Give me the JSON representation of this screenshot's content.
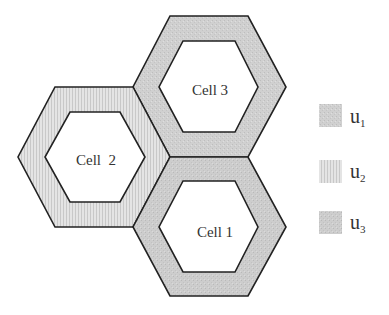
{
  "diagram": {
    "cells": [
      {
        "id": "cell-1",
        "label": "Cell 1",
        "user": "u3"
      },
      {
        "id": "cell-2",
        "label": "Cell  2",
        "user": "u2"
      },
      {
        "id": "cell-3",
        "label": "Cell 3",
        "user": "u1"
      }
    ],
    "legend": [
      {
        "base": "u",
        "sub": "1",
        "pattern": "gray-dotted",
        "color": "#cfcfcf"
      },
      {
        "base": "u",
        "sub": "2",
        "pattern": "vertical-stripes",
        "color": "#dedede"
      },
      {
        "base": "u",
        "sub": "3",
        "pattern": "gray-dotted",
        "color": "#cccccc"
      }
    ],
    "colors": {
      "stroke": "#222222",
      "u1": "#cfcfcf",
      "u2": "#dedede",
      "u3": "#cccccc",
      "inner": "#ffffff"
    }
  }
}
